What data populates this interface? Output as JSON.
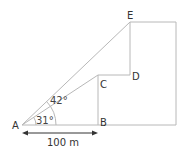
{
  "diagram": {
    "points": {
      "A": {
        "label": "A",
        "x": 22,
        "y": 125
      },
      "B": {
        "label": "B",
        "x": 98,
        "y": 125
      },
      "C": {
        "label": "C",
        "x": 98,
        "y": 75
      },
      "D": {
        "label": "D",
        "x": 130,
        "y": 75
      },
      "E": {
        "label": "E",
        "x": 130,
        "y": 22
      }
    },
    "angles": {
      "lower": "31°",
      "upper": "42°"
    },
    "distance_label": "100 m",
    "colors": {
      "line": "#b8b8b8",
      "text": "#333333"
    }
  }
}
